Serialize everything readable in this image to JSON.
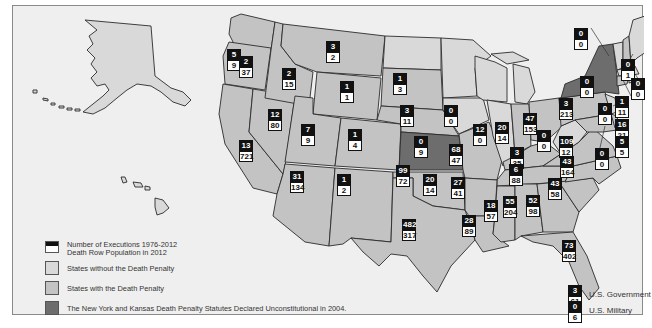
{
  "colors": {
    "background": "#efefef",
    "states_without": "#d9d9d9",
    "states_with": "#c3c3c3",
    "unconstitutional": "#6d6d6d",
    "executions_box": "#111111",
    "death_row_box": "#ffffff"
  },
  "legend": {
    "executions_label": "Number of Executions 1976-2012",
    "death_row_label": "Death Row Population in 2012",
    "without_label": "States without the Death Penalty",
    "with_label": "States with the Death Penalty",
    "unconstitutional_label": "The New York and Kansas Death Penalty Statutes Declared Unconstitutional in 2004."
  },
  "federal": {
    "government": {
      "label": "U.S. Government",
      "executions": "3",
      "death_row": "61"
    },
    "military": {
      "label": "U.S. Military",
      "executions": "0",
      "death_row": "6"
    }
  },
  "states": {
    "WA": {
      "executions": "5",
      "death_row": "9"
    },
    "OR": {
      "executions": "2",
      "death_row": "37"
    },
    "ID": {
      "executions": "2",
      "death_row": "15"
    },
    "MT": {
      "executions": "3",
      "death_row": "2"
    },
    "WY": {
      "executions": "1",
      "death_row": "1"
    },
    "SD": {
      "executions": "1",
      "death_row": "3"
    },
    "NE": {
      "executions": "3",
      "death_row": "11"
    },
    "CA": {
      "executions": "13",
      "death_row": "721"
    },
    "NV": {
      "executions": "12",
      "death_row": "80"
    },
    "UT": {
      "executions": "7",
      "death_row": "9"
    },
    "CO": {
      "executions": "1",
      "death_row": "4"
    },
    "KS": {
      "executions": "0",
      "death_row": "9"
    },
    "AZ": {
      "executions": "31",
      "death_row": "134"
    },
    "NM": {
      "executions": "1",
      "death_row": "2"
    },
    "TX": {
      "executions": "482",
      "death_row": "317"
    },
    "OK": {
      "executions": "99",
      "death_row": "72"
    },
    "IA": {
      "executions": "0",
      "death_row": "0"
    },
    "MO": {
      "executions": "68",
      "death_row": "47"
    },
    "IL": {
      "executions": "12",
      "death_row": "0"
    },
    "IN": {
      "executions": "20",
      "death_row": "14"
    },
    "OH": {
      "executions": "47",
      "death_row": "153"
    },
    "KY": {
      "executions": "3",
      "death_row": "35"
    },
    "WV": {
      "executions": "0",
      "death_row": "0"
    },
    "VA": {
      "executions": "109",
      "death_row": "12"
    },
    "AR": {
      "executions": "27",
      "death_row": "41"
    },
    "LA": {
      "executions": "28",
      "death_row": "89"
    },
    "MS": {
      "executions": "18",
      "death_row": "57"
    },
    "AL": {
      "executions": "55",
      "death_row": "204"
    },
    "GA": {
      "executions": "52",
      "death_row": "98"
    },
    "TN": {
      "executions": "6",
      "death_row": "88"
    },
    "NC": {
      "executions": "43",
      "death_row": "164"
    },
    "SC": {
      "executions": "43",
      "death_row": "58"
    },
    "FL": {
      "executions": "73",
      "death_row": "402"
    },
    "PA": {
      "executions": "3",
      "death_row": "213"
    },
    "NY": {
      "executions": "0",
      "death_row": "0"
    },
    "VT": {
      "executions": "0",
      "death_row": "0"
    },
    "NH": {
      "executions": "0",
      "death_row": "1"
    },
    "MA": {
      "executions": "0",
      "death_row": "0"
    },
    "CT": {
      "executions": "1",
      "death_row": "11"
    },
    "NJ": {
      "executions": "0",
      "death_row": "0"
    },
    "DE": {
      "executions": "16",
      "death_row": "21"
    },
    "MD": {
      "executions": "5",
      "death_row": "5"
    },
    "DC": {
      "executions": "0",
      "death_row": "0"
    },
    "AR_TX_border_label": {
      "executions": "20",
      "death_row": "14"
    }
  }
}
